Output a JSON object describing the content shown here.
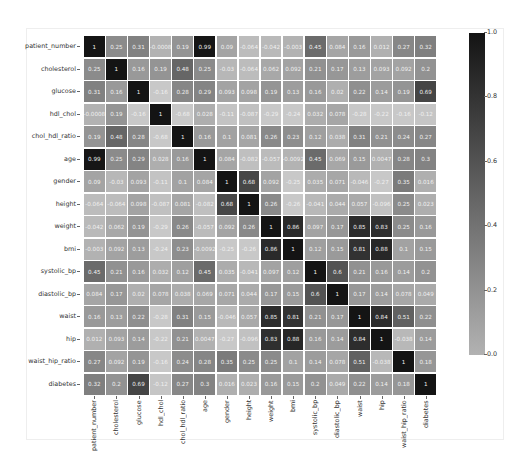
{
  "chart_data": {
    "type": "heatmap",
    "title": "",
    "xlabel": "",
    "ylabel": "",
    "annotated": true,
    "colormap": "grayscale (light gray = low, black = high)",
    "vmin": 0.0,
    "vmax": 1.0,
    "labels": [
      "patient_number",
      "cholesterol",
      "glucose",
      "hdl_chol",
      "chol_hdl_ratio",
      "age",
      "gender",
      "height",
      "weight",
      "bmi",
      "systolic_bp",
      "diastolic_bp",
      "waist",
      "hip",
      "waist_hip_ratio",
      "diabetes"
    ],
    "matrix": [
      [
        "1",
        "0.25",
        "0.31",
        "-0.0008",
        "0.19",
        "0.99",
        "0.09",
        "-0.064",
        "-0.042",
        "-0.003",
        "0.45",
        "0.084",
        "0.16",
        "0.012",
        "0.27",
        "0.32"
      ],
      [
        "0.25",
        "1",
        "0.16",
        "0.19",
        "0.48",
        "0.25",
        "-0.03",
        "-0.064",
        "0.062",
        "0.092",
        "0.21",
        "0.17",
        "0.13",
        "0.093",
        "0.092",
        "0.2"
      ],
      [
        "0.31",
        "0.16",
        "1",
        "-0.16",
        "0.28",
        "0.29",
        "0.093",
        "0.098",
        "0.19",
        "0.13",
        "0.16",
        "0.02",
        "0.22",
        "0.14",
        "0.19",
        "0.69"
      ],
      [
        "-0.0008",
        "0.19",
        "-0.16",
        "1",
        "-0.68",
        "0.028",
        "-0.11",
        "-0.087",
        "-0.29",
        "-0.24",
        "0.032",
        "0.078",
        "-0.28",
        "-0.22",
        "-0.16",
        "-0.12"
      ],
      [
        "0.19",
        "0.48",
        "0.28",
        "-0.68",
        "1",
        "0.16",
        "0.1",
        "0.081",
        "0.26",
        "0.23",
        "0.12",
        "0.038",
        "0.31",
        "0.21",
        "0.24",
        "0.27"
      ],
      [
        "0.99",
        "0.25",
        "0.29",
        "0.028",
        "0.16",
        "1",
        "0.084",
        "-0.082",
        "-0.057",
        "-0.0092",
        "0.45",
        "0.069",
        "0.15",
        "0.0047",
        "0.28",
        "0.3"
      ],
      [
        "0.09",
        "-0.03",
        "0.093",
        "-0.11",
        "0.1",
        "0.084",
        "1",
        "0.68",
        "0.092",
        "-0.25",
        "0.035",
        "0.071",
        "-0.046",
        "-0.27",
        "0.35",
        "0.016"
      ],
      [
        "-0.064",
        "-0.064",
        "0.098",
        "-0.087",
        "0.081",
        "-0.082",
        "0.68",
        "1",
        "0.26",
        "-0.26",
        "-0.041",
        "0.044",
        "0.057",
        "-0.096",
        "0.25",
        "0.023"
      ],
      [
        "-0.042",
        "0.062",
        "0.19",
        "-0.29",
        "0.26",
        "-0.057",
        "0.092",
        "0.26",
        "1",
        "0.86",
        "0.097",
        "0.17",
        "0.85",
        "0.83",
        "0.25",
        "0.16"
      ],
      [
        "-0.003",
        "0.092",
        "0.13",
        "-0.24",
        "0.23",
        "-0.0092",
        "-0.25",
        "-0.26",
        "0.86",
        "1",
        "0.12",
        "0.15",
        "0.81",
        "0.88",
        "0.1",
        "0.15"
      ],
      [
        "0.45",
        "0.21",
        "0.16",
        "0.032",
        "0.12",
        "0.45",
        "0.035",
        "-0.041",
        "0.097",
        "0.12",
        "1",
        "0.6",
        "0.21",
        "0.16",
        "0.14",
        "0.2"
      ],
      [
        "0.084",
        "0.17",
        "0.02",
        "0.078",
        "0.038",
        "0.069",
        "0.071",
        "0.044",
        "0.17",
        "0.15",
        "0.6",
        "1",
        "0.17",
        "0.14",
        "0.078",
        "0.049"
      ],
      [
        "0.16",
        "0.13",
        "0.22",
        "-0.28",
        "0.31",
        "0.15",
        "-0.046",
        "0.057",
        "0.85",
        "0.81",
        "0.21",
        "0.17",
        "1",
        "0.84",
        "0.51",
        "0.22"
      ],
      [
        "0.012",
        "0.093",
        "0.14",
        "-0.22",
        "0.21",
        "0.0047",
        "-0.27",
        "-0.096",
        "0.83",
        "0.88",
        "0.16",
        "0.14",
        "0.84",
        "1",
        "-0.038",
        "0.14"
      ],
      [
        "0.27",
        "0.092",
        "0.19",
        "-0.16",
        "0.24",
        "0.28",
        "0.35",
        "0.25",
        "0.25",
        "0.1",
        "0.14",
        "0.078",
        "0.51",
        "-0.038",
        "1",
        "0.18"
      ],
      [
        "0.32",
        "0.2",
        "0.69",
        "-0.12",
        "0.27",
        "0.3",
        "0.016",
        "0.023",
        "0.16",
        "0.15",
        "0.2",
        "0.049",
        "0.22",
        "0.14",
        "0.18",
        "1"
      ]
    ],
    "colorbar": {
      "ticks": [
        "1.0",
        "0.8",
        "0.6",
        "0.4",
        "0.2",
        "0.0"
      ],
      "range": [
        0.0,
        1.0
      ],
      "position": "right"
    },
    "grid": false,
    "legend": "colorbar right"
  }
}
